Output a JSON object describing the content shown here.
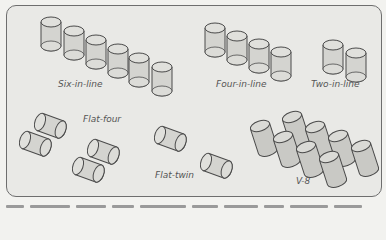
{
  "diagram": {
    "groups": [
      {
        "id": "six-in-line",
        "label": "Six-in-line",
        "cylinders": 6
      },
      {
        "id": "four-in-line",
        "label": "Four-in-line",
        "cylinders": 4
      },
      {
        "id": "two-in-line",
        "label": "Two-in-line",
        "cylinders": 2
      },
      {
        "id": "flat-four",
        "label": "Flat-four",
        "cylinders": 4
      },
      {
        "id": "flat-twin",
        "label": "Flat-twin",
        "cylinders": 2
      },
      {
        "id": "v-8",
        "label": "V-8",
        "cylinders": 8
      }
    ],
    "colors": {
      "background": "#e9e9e6",
      "cylinder_fill": "#d4d4d0",
      "cylinder_stroke": "#4a4a4a",
      "label": "#555555"
    }
  }
}
